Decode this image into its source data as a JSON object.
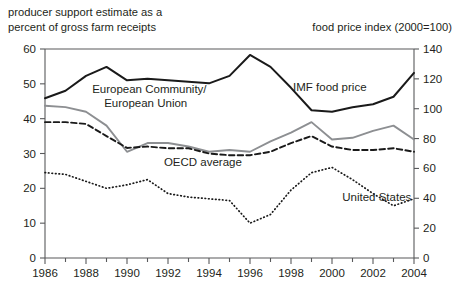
{
  "chart_data": {
    "type": "line",
    "title": "",
    "left_axis_header": "producer support estimate as a\npercent of gross farm receipts",
    "left_axis_header_line1": "producer support estimate as a",
    "left_axis_header_line2": "percent of gross farm receipts",
    "right_axis_header": "food price index (2000=100)",
    "xlabel": "",
    "ylabel": "",
    "y2label": "",
    "x": [
      1986,
      1987,
      1988,
      1989,
      1990,
      1991,
      1992,
      1993,
      1994,
      1995,
      1996,
      1997,
      1998,
      1999,
      2000,
      2001,
      2002,
      2003,
      2004
    ],
    "xlim": [
      1986,
      2004
    ],
    "xticks_major": [
      1986,
      1988,
      1990,
      1992,
      1994,
      1996,
      1998,
      2000,
      2002,
      2004
    ],
    "xtick_labels": [
      "1986",
      "1988",
      "1990",
      "1992",
      "1994",
      "1996",
      "1998",
      "2000",
      "2002",
      "2004"
    ],
    "xticks_minor": [
      1987,
      1989,
      1991,
      1993,
      1995,
      1997,
      1999,
      2001,
      2003
    ],
    "ylim": [
      0,
      60
    ],
    "yticks": [
      0,
      10,
      20,
      30,
      40,
      50,
      60
    ],
    "ytick_labels": [
      "0",
      "10",
      "20",
      "30",
      "40",
      "50",
      "60"
    ],
    "y2lim": [
      0,
      140
    ],
    "y2ticks": [
      0,
      20,
      40,
      60,
      80,
      100,
      120,
      140
    ],
    "y2tick_labels": [
      "0",
      "20",
      "40",
      "60",
      "80",
      "100",
      "120",
      "140"
    ],
    "grid": false,
    "legend_position": "inline-annotations",
    "series": [
      {
        "name": "IMF food price",
        "axis": "right",
        "style": "solid",
        "color": "#1a1a1a",
        "label_x": 1998.1,
        "label_y": 112,
        "values": [
          107,
          112,
          122,
          128,
          119,
          120,
          119,
          118,
          117,
          122,
          136,
          128,
          114,
          99,
          98,
          101,
          103,
          108,
          124
        ]
      },
      {
        "name": "European Community/\nEuropean Union",
        "name_line1": "European Community/",
        "name_line2": "European Union",
        "axis": "left",
        "style": "solid",
        "color": "#8d8f92",
        "label_x": 1988.3,
        "label_y": 47.5,
        "values": [
          43.7,
          43.3,
          42.0,
          38.0,
          30.5,
          33.0,
          33.0,
          32.0,
          30.5,
          31.0,
          30.5,
          33.5,
          36.0,
          39.0,
          34.0,
          34.5,
          36.5,
          38.0,
          34.0
        ]
      },
      {
        "name": "OECD average",
        "axis": "left",
        "style": "dashed",
        "color": "#1a1a1a",
        "label_x": 1991.8,
        "label_y": 26.5,
        "values": [
          39.0,
          39.0,
          38.5,
          35.0,
          31.6,
          32.0,
          31.5,
          31.5,
          30.0,
          29.5,
          29.5,
          30.5,
          33.0,
          35.0,
          32.0,
          31.0,
          31.0,
          31.5,
          30.5
        ]
      },
      {
        "name": "United States",
        "axis": "left",
        "style": "dotted",
        "color": "#1a1a1a",
        "label_x": 2000.5,
        "label_y": 16.5,
        "values": [
          24.5,
          24.0,
          22.0,
          20.0,
          21.0,
          22.5,
          18.5,
          17.5,
          17.0,
          16.5,
          10.0,
          12.5,
          19.5,
          24.5,
          26.0,
          22.5,
          18.5,
          15.0,
          17.0
        ]
      }
    ]
  }
}
